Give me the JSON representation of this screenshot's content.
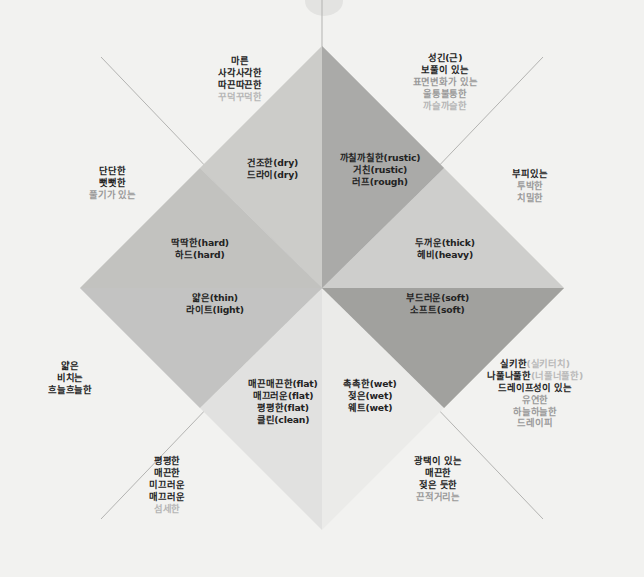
{
  "diagram": {
    "center": {
      "x": 322,
      "y": 288
    },
    "colors": {
      "background": "#f2f2f0",
      "sector_darkest": "#9e9e9e",
      "sector_dark": "#a8a8a8",
      "sector_mid": "#b9b9b9",
      "sector_light": "#cfcfcf",
      "sector_lighter": "#dcdcda",
      "sector_lightest": "#e6e6e4",
      "text_dark": "#232323",
      "text_gray": "#b6b6b6",
      "axis_line": "#b0b0ae"
    }
  },
  "labels": {
    "top_left_inner": {
      "lines": [
        "마른",
        "사각사각한",
        "따끈따끈한",
        "꾸덕꾸덕한"
      ],
      "styles": [
        "b",
        "b",
        "b",
        "g"
      ]
    },
    "top_right_inner": {
      "lines": [
        "성긴(근)",
        "보풀이 있는",
        "표면변화가 있는",
        "울퉁불퉁한",
        "까슬까슬한"
      ],
      "styles": [
        "b",
        "b",
        "g2",
        "g2",
        "g"
      ]
    },
    "dry_axis": {
      "lines": [
        "건조한(dry)",
        "드라이(dry)"
      ],
      "styles": [
        "b",
        "b"
      ]
    },
    "rustic_axis": {
      "lines": [
        "까칠까칠한(rustic)",
        "거친(rustic)",
        "러프(rough)"
      ],
      "styles": [
        "b",
        "b",
        "b"
      ]
    },
    "left_outer": {
      "lines": [
        "단단한",
        "뻣뻣한",
        "풀기가 있는"
      ],
      "styles": [
        "b",
        "b",
        "g2"
      ]
    },
    "right_outer": {
      "lines": [
        "부피있는",
        "투박한",
        "치밀한"
      ],
      "styles": [
        "b",
        "g2",
        "g2"
      ]
    },
    "hard_axis": {
      "lines": [
        "딱딱한(hard)",
        "하드(hard)"
      ],
      "styles": [
        "b",
        "b"
      ]
    },
    "thick_axis": {
      "lines": [
        "두꺼운(thick)",
        "헤비(heavy)"
      ],
      "styles": [
        "b",
        "b"
      ]
    },
    "thin_axis": {
      "lines": [
        "얇은(thin)",
        "라이트(light)"
      ],
      "styles": [
        "b",
        "b"
      ]
    },
    "soft_axis": {
      "lines": [
        "부드러운(soft)",
        "소프트(soft)"
      ],
      "styles": [
        "b",
        "b"
      ]
    },
    "left_lower_outer": {
      "lines": [
        "얇은",
        "비치는",
        "흐늘흐늘한"
      ],
      "styles": [
        "b",
        "b",
        "b"
      ]
    },
    "flat_axis": {
      "lines": [
        "매끈매끈한(flat)",
        "매끄러운(flat)",
        "평평한(flat)",
        "클린(clean)"
      ],
      "styles": [
        "b",
        "b",
        "b",
        "b"
      ]
    },
    "wet_axis": {
      "lines": [
        "촉촉한(wet)",
        "젖은(wet)",
        "웨트(wet)"
      ],
      "styles": [
        "b",
        "b",
        "b"
      ]
    },
    "right_lower_outer": {
      "lines": [
        "실키한(실키터치)",
        "나풀나풀한(너풀너풀한)",
        "드레이프성이 있는",
        "유연한",
        "하늘하늘한",
        "드레이피"
      ],
      "styles": [
        "mix",
        "mix",
        "b",
        "g2",
        "g2",
        "g2"
      ],
      "mix_main": [
        "실키한",
        "나풀나풀한"
      ],
      "mix_sub": [
        "(실키터치)",
        "(너풀너풀한)"
      ]
    },
    "bottom_left_inner": {
      "lines": [
        "평평한",
        "매끈한",
        "미끄러운",
        "매끄러운",
        "섬세한"
      ],
      "styles": [
        "b",
        "b",
        "b",
        "b",
        "g"
      ]
    },
    "bottom_right_inner": {
      "lines": [
        "광택이 있는",
        "매끈한",
        "젖은 듯한",
        "끈적거리는"
      ],
      "styles": [
        "b",
        "b",
        "b",
        "g2"
      ]
    }
  }
}
